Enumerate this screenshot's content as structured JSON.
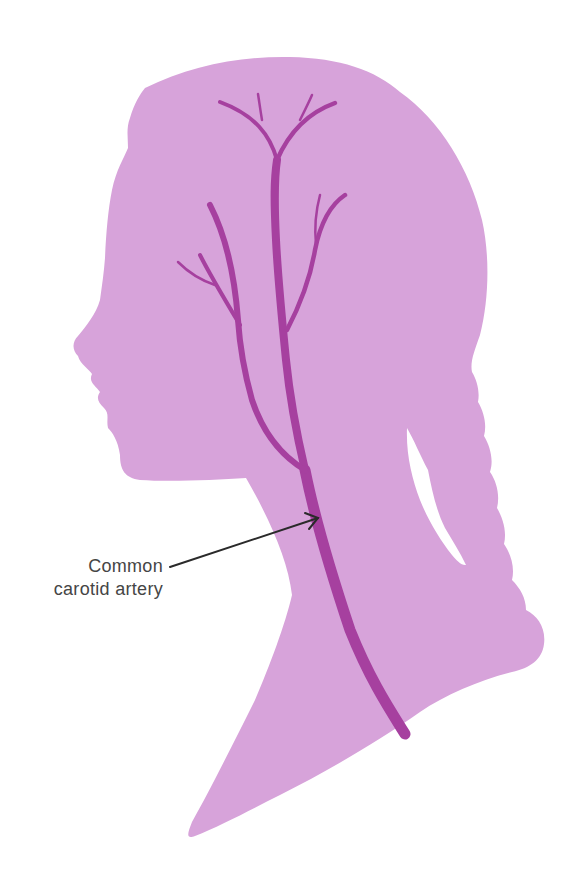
{
  "figure": {
    "colors": {
      "background": "#ffffff",
      "silhouette": "#d7a3da",
      "artery": "#a6409f",
      "annotation_line": "#2a2a2a",
      "label_text": "#454545"
    }
  },
  "annotations": [
    {
      "id": "common-carotid",
      "lines": [
        "Common",
        "carotid artery"
      ],
      "arrow_from": [
        170,
        567
      ],
      "arrow_to": [
        318,
        518
      ]
    }
  ]
}
